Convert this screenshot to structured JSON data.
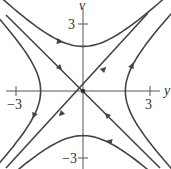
{
  "chart_data": {
    "type": "line",
    "title": "",
    "subtitle": "Phase portrait of a saddle point",
    "xlabel": "y",
    "ylabel": "v",
    "xlim": [
      -3.7,
      3.8
    ],
    "ylim": [
      -3.5,
      4.0
    ],
    "x_ticks": [
      {
        "value": -3,
        "label": "−3"
      },
      {
        "value": 3,
        "label": "3"
      }
    ],
    "y_ticks": [
      {
        "value": 3,
        "label": "3"
      },
      {
        "value": -3,
        "label": "−3"
      }
    ],
    "grid": false,
    "legend": null,
    "equilibrium": {
      "x": 0,
      "y": 0,
      "type": "saddle"
    },
    "series": [
      {
        "name": "unstable-eigenline",
        "equation": "v = y",
        "direction": "away from origin"
      },
      {
        "name": "stable-eigenline",
        "equation": "v = -y",
        "direction": "toward origin"
      },
      {
        "name": "top-hyperbola",
        "equation": "v^2 - y^2 = 4, v>0",
        "vertex": [
          0,
          2
        ],
        "direction": "left to right"
      },
      {
        "name": "bottom-hyperbola",
        "equation": "v^2 - y^2 = 4, v<0",
        "vertex": [
          0,
          -2
        ],
        "direction": "right to left"
      },
      {
        "name": "left-hyperbola",
        "equation": "y^2 - v^2 = 3.6, y<0",
        "vertex": [
          -1.9,
          0
        ],
        "direction": "top to bottom"
      },
      {
        "name": "right-hyperbola",
        "equation": "y^2 - v^2 = 3.6, y>0",
        "vertex": [
          1.9,
          0
        ],
        "direction": "bottom to top"
      }
    ]
  },
  "labels": {
    "x_axis": "y",
    "y_axis": "v",
    "tick_neg3_x": "−3",
    "tick_pos3_x": "3",
    "tick_pos3_y": "3",
    "tick_neg3_y": "−3"
  }
}
